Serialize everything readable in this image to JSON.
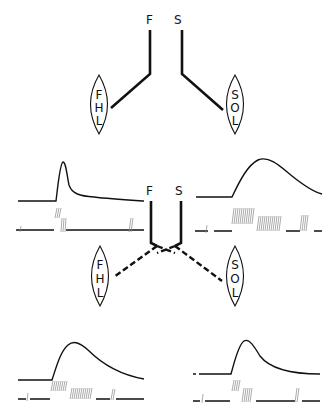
{
  "figure": {
    "top_section": {
      "nerve_labels": {
        "fast": "F",
        "slow": "S"
      },
      "muscles": [
        {
          "name": "FHL",
          "letters": [
            "F",
            "H",
            "L"
          ],
          "innervated_by": "F"
        },
        {
          "name": "SOL",
          "letters": [
            "S",
            "O",
            "L"
          ],
          "innervated_by": "S"
        }
      ],
      "connection_style": "solid"
    },
    "middle_section": {
      "nerve_labels": {
        "fast": "F",
        "slow": "S"
      },
      "muscles": [
        {
          "name": "FHL",
          "letters": [
            "F",
            "H",
            "L"
          ],
          "innervated_by": "S"
        },
        {
          "name": "SOL",
          "letters": [
            "S",
            "O",
            "L"
          ],
          "innervated_by": "F"
        }
      ],
      "connection_style": "dashed (cross-innervation)"
    },
    "traces": [
      {
        "id": "upper-left",
        "description": "fast twitch: brief sharp peak, fast decay",
        "pattern": "brief high-frequency bursts"
      },
      {
        "id": "upper-right",
        "description": "slow twitch: broad peak, slow decay",
        "pattern": "sustained low-frequency discharge"
      },
      {
        "id": "lower-left",
        "description": "slowed twitch after cross-innervation",
        "pattern": "sustained discharge"
      },
      {
        "id": "lower-right",
        "description": "faster twitch after cross-innervation",
        "pattern": "brief bursts"
      }
    ]
  }
}
